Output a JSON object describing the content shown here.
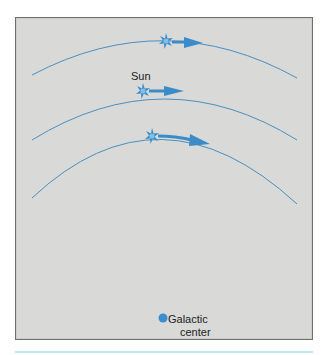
{
  "diagram": {
    "labels": {
      "sun": "Sun",
      "galactic_center_line1": "Galactic",
      "galactic_center_line2": "center"
    },
    "colors": {
      "background": "#d9d9d7",
      "frame_border": "#6e6e6e",
      "orbit": "#4a8fc0",
      "arrow": "#3a8cc8",
      "center_dot": "#3b8ed0",
      "bottom_rule": "#bfe6f3"
    },
    "orbits": [
      {
        "name": "outer-orbit",
        "has_star": true,
        "has_arrow": true
      },
      {
        "name": "sun-orbit",
        "has_star": true,
        "has_arrow": true,
        "label": "Sun"
      },
      {
        "name": "inner-orbit",
        "has_star": true,
        "has_arrow": true
      }
    ],
    "icons": {
      "star": "star-burst-icon",
      "arrow": "velocity-arrow-icon",
      "center": "galactic-center-dot"
    }
  }
}
